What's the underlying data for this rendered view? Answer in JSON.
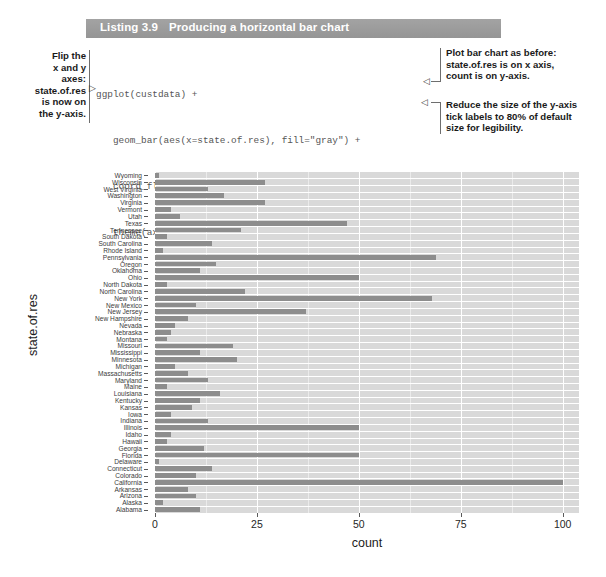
{
  "listing": {
    "number": "Listing 3.9",
    "title": "Producing a horizontal bar chart"
  },
  "code": {
    "lines": [
      "ggplot(custdata) +",
      "   geom_bar(aes(x=state.of.res), fill=\"gray\") +",
      "   coord_flip() +",
      "   theme(axis.text.y=element_text(size=rel(0.8)))"
    ]
  },
  "annotations": {
    "left": "Flip the x and y axes: state.of.res is now on the y-axis.",
    "left_lines": [
      "Flip the",
      "x and y",
      "axes:",
      "state.of.res",
      "is now on",
      "the y-axis."
    ],
    "right_top_lines": [
      "Plot bar chart as before:",
      "state.of.res is on x axis,",
      "count is on y-axis."
    ],
    "right_bottom_lines": [
      "Reduce the size of the y-axis",
      "tick labels to 80% of default",
      "size for legibility."
    ]
  },
  "chart_data": {
    "type": "bar",
    "orientation": "horizontal",
    "title": "",
    "xlabel": "count",
    "ylabel": "state.of.res",
    "xlim": [
      0,
      104
    ],
    "xticks": [
      0,
      25,
      50,
      75,
      100
    ],
    "xtick_labels": [
      "0",
      "25",
      "50",
      "75",
      "100"
    ],
    "grid": true,
    "legend": "none",
    "bar_color": "#8d8d8d",
    "panel_color": "#d9d9d9",
    "categories": [
      "Wyoming",
      "Wisconsin",
      "West Virginia",
      "Washington",
      "Virginia",
      "Vermont",
      "Utah",
      "Texas",
      "Tennessee",
      "South Dakota",
      "South Carolina",
      "Rhode Island",
      "Pennsylvania",
      "Oregon",
      "Oklahoma",
      "Ohio",
      "North Dakota",
      "North Carolina",
      "New York",
      "New Mexico",
      "New Jersey",
      "New Hampshire",
      "Nevada",
      "Nebraska",
      "Montana",
      "Missouri",
      "Mississippi",
      "Minnesota",
      "Michigan",
      "Massachusetts",
      "Maryland",
      "Maine",
      "Louisiana",
      "Kentucky",
      "Kansas",
      "Iowa",
      "Indiana",
      "Illinois",
      "Idaho",
      "Hawaii",
      "Georgia",
      "Florida",
      "Delaware",
      "Connecticut",
      "Colorado",
      "California",
      "Arkansas",
      "Arizona",
      "Alaska",
      "Alabama"
    ],
    "values": [
      1,
      27,
      13,
      17,
      27,
      4,
      6,
      47,
      21,
      3,
      14,
      2,
      69,
      15,
      11,
      50,
      3,
      22,
      68,
      10,
      37,
      8,
      5,
      4,
      3,
      19,
      11,
      20,
      5,
      8,
      13,
      3,
      16,
      11,
      9,
      4,
      13,
      50,
      4,
      3,
      12,
      50,
      1,
      14,
      10,
      100,
      8,
      10,
      2,
      11
    ]
  }
}
